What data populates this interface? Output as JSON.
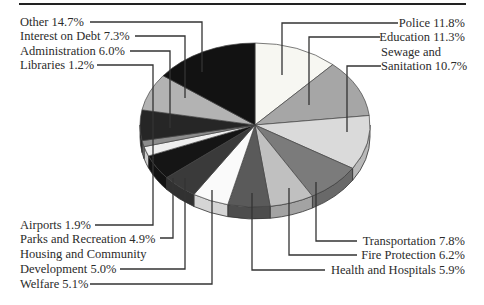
{
  "chart_data": {
    "type": "pie",
    "title": "",
    "style": "3d-tilted",
    "unit": "%",
    "slices": [
      {
        "label": "Police",
        "value": 11.8,
        "color": "#f7f7f2"
      },
      {
        "label": "Education",
        "value": 11.3,
        "color": "#a6a6a6"
      },
      {
        "label": "Sewage and Sanitation",
        "value": 10.7,
        "color": "#dadada"
      },
      {
        "label": "Transportation",
        "value": 7.8,
        "color": "#7b7b7b"
      },
      {
        "label": "Fire Protection",
        "value": 6.2,
        "color": "#c0c0c0"
      },
      {
        "label": "Health and Hospitals",
        "value": 5.9,
        "color": "#5a5a5a"
      },
      {
        "label": "Welfare",
        "value": 5.1,
        "color": "#fafafa"
      },
      {
        "label": "Housing and Community Development",
        "value": 5.0,
        "color": "#3a3a3a"
      },
      {
        "label": "Parks and Recreation",
        "value": 4.9,
        "color": "#151515"
      },
      {
        "label": "Airports",
        "value": 1.9,
        "color": "#efefef"
      },
      {
        "label": "Libraries",
        "value": 1.2,
        "color": "#8c8c8c"
      },
      {
        "label": "Administration",
        "value": 6.0,
        "color": "#262626"
      },
      {
        "label": "Interest on Debt",
        "value": 7.3,
        "color": "#b3b3b3"
      },
      {
        "label": "Other",
        "value": 14.7,
        "color": "#121212"
      }
    ],
    "legend_position": "callout-labels"
  },
  "labels": {
    "other": "Other 14.7%",
    "interest": "Interest on Debt 7.3%",
    "administration": "Administration 6.0%",
    "libraries": "Libraries 1.2%",
    "police": "Police 11.8%",
    "education": "Education 11.3%",
    "sewage_1": "Sewage and",
    "sewage_2": "Sanitation 10.7%",
    "airports": "Airports 1.9%",
    "parks": "Parks and Recreation 4.9%",
    "housing_1": "Housing and Community",
    "housing_2": "Development 5.0%",
    "welfare": "Welfare 5.1%",
    "transportation": "Transportation 7.8%",
    "fire": "Fire Protection 6.2%",
    "health": "Health and Hospitals 5.9%"
  }
}
